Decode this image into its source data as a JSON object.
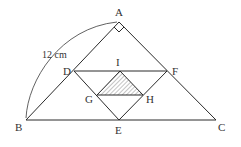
{
  "diagram": {
    "measurement": {
      "label": "12 cm",
      "side": "AB"
    },
    "right_angle_at": "A",
    "shaded_region": [
      "I",
      "G",
      "H"
    ],
    "points": {
      "A": {
        "label": "A",
        "x": 119,
        "y": 22
      },
      "B": {
        "label": "B",
        "x": 26,
        "y": 120
      },
      "C": {
        "label": "C",
        "x": 216,
        "y": 120
      },
      "D": {
        "label": "D",
        "x": 74,
        "y": 71
      },
      "E": {
        "label": "E",
        "x": 119,
        "y": 120
      },
      "F": {
        "label": "F",
        "x": 167,
        "y": 71
      },
      "G": {
        "label": "G",
        "x": 97,
        "y": 95
      },
      "H": {
        "label": "H",
        "x": 143,
        "y": 95
      },
      "I": {
        "label": "I",
        "x": 120,
        "y": 71
      }
    },
    "segments": [
      "AB",
      "AC",
      "BC",
      "DF",
      "DE",
      "EF",
      "GH",
      "IG",
      "IH"
    ],
    "colors": {
      "line": "#2a2a2a",
      "hatch": "#555555",
      "text": "#333333"
    }
  }
}
